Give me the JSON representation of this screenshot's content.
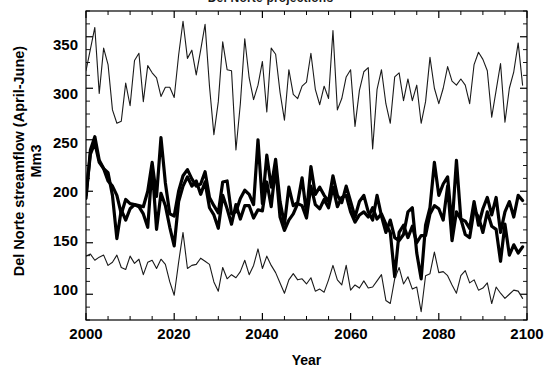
{
  "chart_data": {
    "type": "line",
    "title": "Del Norte projections",
    "xlabel": "Year",
    "ylabel": "Del Norte streamflow  (April-June)\nMm3",
    "xlim": [
      2000,
      2100
    ],
    "ylim": [
      75,
      375
    ],
    "xticks": [
      2000,
      2020,
      2040,
      2060,
      2080,
      2100
    ],
    "yticks": [
      100,
      150,
      200,
      250,
      300,
      350
    ],
    "xtick_labels": [
      "2000",
      "2020",
      "2040",
      "2060",
      "2080",
      "2100"
    ],
    "ytick_labels": [
      "100",
      "150",
      "200",
      "250",
      "300",
      "350"
    ],
    "minor_ticks": true,
    "grid": false,
    "legend": "none",
    "x": [
      2000,
      2001,
      2002,
      2003,
      2004,
      2005,
      2006,
      2007,
      2008,
      2009,
      2010,
      2011,
      2012,
      2013,
      2014,
      2015,
      2016,
      2017,
      2018,
      2019,
      2020,
      2021,
      2022,
      2023,
      2024,
      2025,
      2026,
      2027,
      2028,
      2029,
      2030,
      2031,
      2032,
      2033,
      2034,
      2035,
      2036,
      2037,
      2038,
      2039,
      2040,
      2041,
      2042,
      2043,
      2044,
      2045,
      2046,
      2047,
      2048,
      2049,
      2050,
      2051,
      2052,
      2053,
      2054,
      2055,
      2056,
      2057,
      2058,
      2059,
      2060,
      2061,
      2062,
      2063,
      2064,
      2065,
      2066,
      2067,
      2068,
      2069,
      2070,
      2071,
      2072,
      2073,
      2074,
      2075,
      2076,
      2077,
      2078,
      2079,
      2080,
      2081,
      2082,
      2083,
      2084,
      2085,
      2086,
      2087,
      2088,
      2089,
      2090,
      2091,
      2092,
      2093,
      2094,
      2095,
      2096,
      2097,
      2098,
      2099
    ],
    "series": [
      {
        "name": "upper-bound",
        "style": "thin",
        "color": "#1a1a1a",
        "width": 1.1,
        "values": [
          317,
          338,
          359,
          295,
          339,
          323,
          279,
          266,
          268,
          305,
          283,
          327,
          334,
          287,
          322,
          315,
          310,
          292,
          301,
          301,
          291,
          332,
          365,
          329,
          337,
          313,
          337,
          362,
          302,
          255,
          287,
          345,
          318,
          317,
          240,
          285,
          348,
          310,
          289,
          303,
          326,
          277,
          339,
          333,
          296,
          269,
          318,
          294,
          290,
          302,
          306,
          334,
          299,
          284,
          302,
          290,
          356,
          279,
          290,
          311,
          318,
          263,
          298,
          316,
          320,
          241,
          299,
          318,
          285,
          266,
          311,
          315,
          288,
          309,
          288,
          303,
          266,
          287,
          330,
          300,
          285,
          300,
          321,
          307,
          303,
          309,
          303,
          285,
          323,
          335,
          328,
          317,
          272,
          298,
          324,
          267,
          300,
          316,
          344,
          303
        ]
      },
      {
        "name": "projection-a",
        "style": "thick",
        "color": "#000000",
        "width": 3.2,
        "values": [
          193,
          240,
          253,
          230,
          222,
          210,
          205,
          196,
          178,
          192,
          188,
          187,
          186,
          185,
          200,
          228,
          195,
          252,
          208,
          178,
          176,
          200,
          215,
          221,
          212,
          205,
          207,
          219,
          194,
          186,
          179,
          209,
          210,
          178,
          180,
          193,
          201,
          197,
          187,
          250,
          188,
          235,
          204,
          231,
          190,
          168,
          204,
          186,
          189,
          213,
          178,
          224,
          197,
          204,
          196,
          190,
          215,
          196,
          189,
          205,
          190,
          175,
          190,
          196,
          180,
          172,
          196,
          176,
          160,
          172,
          155,
          152,
          158,
          180,
          184,
          140,
          115,
          167,
          184,
          228,
          196,
          207,
          214,
          166,
          230,
          173,
          171,
          164,
          190,
          167,
          183,
          194,
          177,
          194,
          160,
          180,
          190,
          175,
          196,
          191
        ]
      },
      {
        "name": "projection-b",
        "style": "thick",
        "color": "#000000",
        "width": 3.2,
        "values": [
          196,
          236,
          247,
          228,
          222,
          218,
          196,
          154,
          182,
          172,
          183,
          187,
          185,
          178,
          165,
          224,
          163,
          198,
          186,
          165,
          147,
          190,
          205,
          214,
          205,
          210,
          197,
          209,
          184,
          177,
          164,
          196,
          183,
          168,
          187,
          173,
          186,
          186,
          174,
          182,
          181,
          209,
          185,
          224,
          175,
          162,
          172,
          178,
          188,
          186,
          174,
          205,
          187,
          183,
          192,
          184,
          204,
          185,
          194,
          196,
          180,
          170,
          177,
          180,
          175,
          184,
          173,
          178,
          168,
          160,
          117,
          160,
          167,
          155,
          166,
          150,
          157,
          157,
          178,
          186,
          183,
          172,
          205,
          152,
          180,
          173,
          158,
          155,
          182,
          175,
          160,
          180,
          166,
          163,
          132,
          168,
          138,
          148,
          140,
          146
        ]
      },
      {
        "name": "lower-bound",
        "style": "thin",
        "color": "#1a1a1a",
        "width": 1.1,
        "values": [
          137,
          139,
          133,
          136,
          138,
          128,
          131,
          138,
          126,
          124,
          137,
          130,
          134,
          119,
          131,
          133,
          125,
          134,
          129,
          112,
          99,
          131,
          160,
          125,
          128,
          129,
          135,
          132,
          129,
          112,
          103,
          126,
          115,
          119,
          116,
          122,
          133,
          119,
          128,
          144,
          125,
          137,
          128,
          121,
          111,
          101,
          114,
          120,
          114,
          115,
          110,
          116,
          103,
          105,
          102,
          114,
          128,
          114,
          109,
          128,
          104,
          109,
          106,
          113,
          106,
          107,
          113,
          119,
          94,
          91,
          115,
          126,
          110,
          117,
          105,
          107,
          83,
          118,
          120,
          141,
          121,
          122,
          118,
          109,
          101,
          118,
          123,
          111,
          114,
          104,
          106,
          111,
          91,
          107,
          101,
          96,
          100,
          104,
          103,
          96
        ]
      }
    ]
  },
  "axes": {
    "left_px": 86,
    "right_px": 527,
    "top_px": 11,
    "bottom_px": 320
  }
}
